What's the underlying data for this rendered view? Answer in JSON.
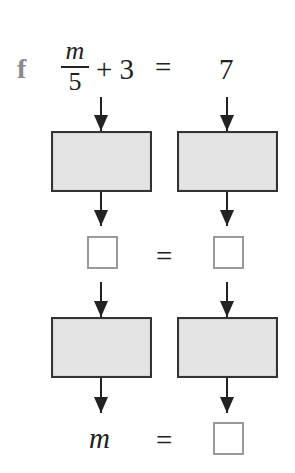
{
  "part_label": "f",
  "equation": {
    "lhs": {
      "fraction": {
        "numerator": "m",
        "denominator": "5"
      },
      "rest": "+ 3"
    },
    "equals": "=",
    "rhs": "7"
  },
  "flow": {
    "row1_operation_boxes": [
      {
        "side": "left",
        "content": ""
      },
      {
        "side": "right",
        "content": ""
      }
    ],
    "middle_row": {
      "left_box": "",
      "equals": "=",
      "right_box": ""
    },
    "row2_operation_boxes": [
      {
        "side": "left",
        "content": ""
      },
      {
        "side": "right",
        "content": ""
      }
    ],
    "result_row": {
      "variable": "m",
      "equals": "=",
      "answer_box": ""
    }
  },
  "colors": {
    "box_fill": "#e4e4e4",
    "box_border": "#333333",
    "answer_border": "#9a9a9a",
    "label": "#8a8a8a"
  }
}
